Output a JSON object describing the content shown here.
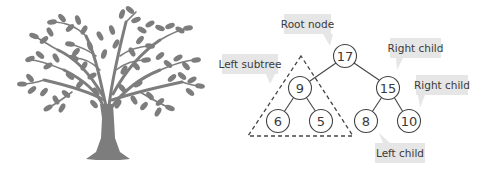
{
  "illustration": {
    "name": "tree-illustration",
    "color": "#7d7d7d"
  },
  "diagram": {
    "line_color": "#444444",
    "callout_bg": "#e6e6e6",
    "nodes": [
      {
        "id": "root",
        "value": "17",
        "x": 345,
        "y": 56
      },
      {
        "id": "n9",
        "value": "9",
        "x": 300,
        "y": 88
      },
      {
        "id": "n15",
        "value": "15",
        "x": 388,
        "y": 88
      },
      {
        "id": "n6",
        "value": "6",
        "x": 278,
        "y": 121
      },
      {
        "id": "n5",
        "value": "5",
        "x": 321,
        "y": 121
      },
      {
        "id": "n8",
        "value": "8",
        "x": 366,
        "y": 121
      },
      {
        "id": "n10",
        "value": "10",
        "x": 409,
        "y": 121
      }
    ],
    "edges": [
      [
        "root",
        "n9"
      ],
      [
        "root",
        "n15"
      ],
      [
        "n9",
        "n6"
      ],
      [
        "n9",
        "n5"
      ],
      [
        "n15",
        "n8"
      ],
      [
        "n15",
        "n10"
      ]
    ],
    "callouts": {
      "root_node": "Root node",
      "left_subtree": "Left subtree",
      "right_child_1": "Right child",
      "right_child_2": "Right child",
      "left_child": "Left child"
    }
  }
}
